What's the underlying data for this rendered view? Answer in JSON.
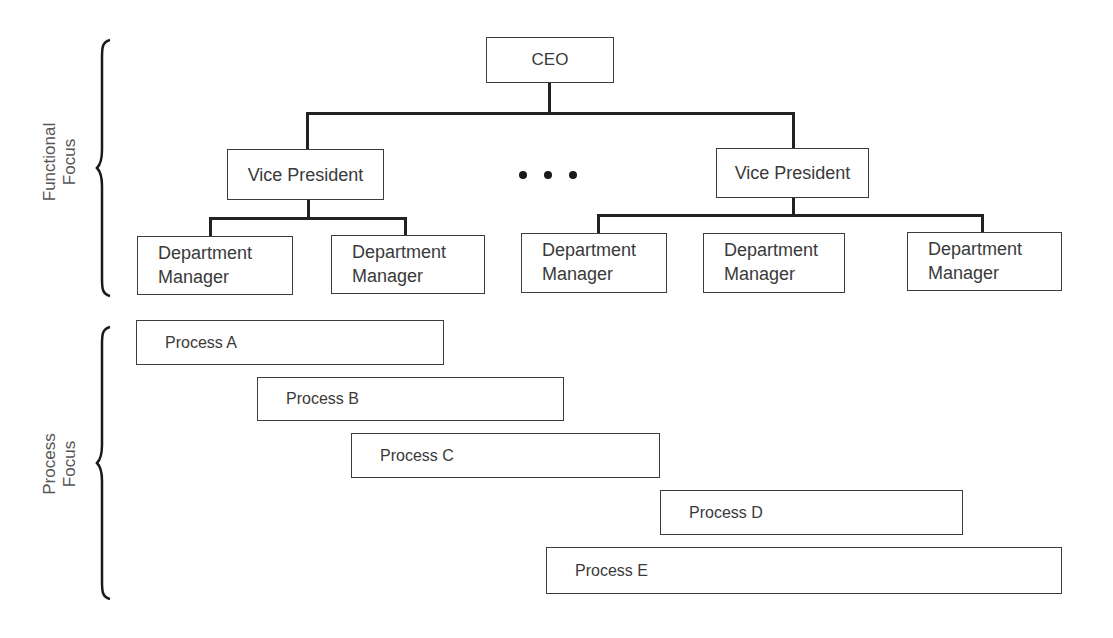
{
  "side_labels": {
    "functional": [
      "Functional",
      "Focus"
    ],
    "process": [
      "Process",
      "Focus"
    ]
  },
  "org_chart": {
    "ceo": {
      "label": "CEO"
    },
    "vice_presidents": [
      {
        "label": "Vice President",
        "department_managers": [
          {
            "line1": "Department",
            "line2": "Manager"
          },
          {
            "line1": "Department",
            "line2": "Manager"
          }
        ]
      },
      {
        "label": "Vice President",
        "department_managers": [
          {
            "line1": "Department",
            "line2": "Manager"
          },
          {
            "line1": "Department",
            "line2": "Manager"
          },
          {
            "line1": "Department",
            "line2": "Manager"
          }
        ]
      }
    ],
    "ellipsis": "• • •"
  },
  "processes": [
    {
      "label": "Process A"
    },
    {
      "label": "Process B"
    },
    {
      "label": "Process C"
    },
    {
      "label": "Process D"
    },
    {
      "label": "Process E"
    }
  ],
  "colors": {
    "line": "#222222",
    "box_border": "#3c3c3c",
    "text": "#3a3a3a",
    "background": "#ffffff"
  }
}
